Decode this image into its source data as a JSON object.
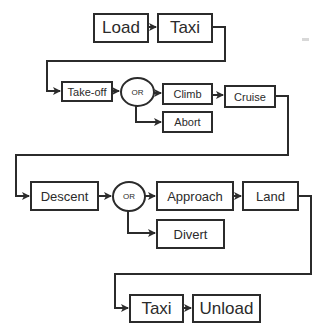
{
  "diagram": {
    "type": "flight-phase flowchart",
    "stroke_color": "#2b2b2b",
    "background": "#ffffff",
    "nodes": {
      "load": {
        "label": "Load"
      },
      "taxi_out": {
        "label": "Taxi"
      },
      "takeoff": {
        "label": "Take-off"
      },
      "or1": {
        "label": "OR"
      },
      "climb": {
        "label": "Climb"
      },
      "abort": {
        "label": "Abort"
      },
      "cruise": {
        "label": "Cruise"
      },
      "descent": {
        "label": "Descent"
      },
      "or2": {
        "label": "OR"
      },
      "approach": {
        "label": "Approach"
      },
      "divert": {
        "label": "Divert"
      },
      "land": {
        "label": "Land"
      },
      "taxi_in": {
        "label": "Taxi"
      },
      "unload": {
        "label": "Unload"
      }
    },
    "edges": [
      {
        "from": "Load",
        "to": "Taxi"
      },
      {
        "from": "Taxi",
        "to": "Take-off"
      },
      {
        "from": "Take-off",
        "to": "OR"
      },
      {
        "from": "OR",
        "to": "Climb"
      },
      {
        "from": "OR",
        "to": "Abort"
      },
      {
        "from": "Climb",
        "to": "Cruise"
      },
      {
        "from": "Cruise",
        "to": "Descent"
      },
      {
        "from": "Descent",
        "to": "OR"
      },
      {
        "from": "OR",
        "to": "Approach"
      },
      {
        "from": "OR",
        "to": "Divert"
      },
      {
        "from": "Approach",
        "to": "Land"
      },
      {
        "from": "Land",
        "to": "Taxi"
      },
      {
        "from": "Taxi",
        "to": "Unload"
      }
    ]
  }
}
